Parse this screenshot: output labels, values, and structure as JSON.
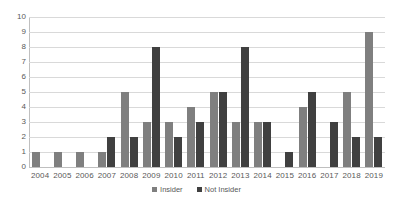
{
  "chart_data": {
    "type": "bar",
    "title": "",
    "subtitle": "",
    "xlabel": "",
    "ylabel": "",
    "ylim": [
      0,
      10
    ],
    "ytick_labels": [
      "10",
      "9",
      "8",
      "7",
      "6",
      "5",
      "4",
      "3",
      "2",
      "1",
      "0"
    ],
    "yticks": [
      10,
      9,
      8,
      7,
      6,
      5,
      4,
      3,
      2,
      1,
      0
    ],
    "grid": true,
    "grid_axis": "y",
    "legend_position": "bottom",
    "categories": [
      "2004",
      "2005",
      "2006",
      "2007",
      "2008",
      "2009",
      "2010",
      "2011",
      "2012",
      "2013",
      "2014",
      "2015",
      "2016",
      "2017",
      "2018",
      "2019"
    ],
    "series": [
      {
        "name": "Insider",
        "color": "#7f7f7f",
        "values": [
          1,
          1,
          1,
          1,
          5,
          3,
          3,
          4,
          5,
          3,
          3,
          0,
          4,
          0,
          5,
          9
        ]
      },
      {
        "name": "Not Insider",
        "color": "#404040",
        "values": [
          0,
          0,
          0,
          2,
          2,
          8,
          2,
          3,
          5,
          8,
          3,
          1,
          5,
          3,
          2,
          2
        ]
      }
    ]
  },
  "legend": {
    "items": [
      {
        "label": "Insider",
        "swatch": "legend-swatch-insider"
      },
      {
        "label": "Not Insider",
        "swatch": "legend-swatch-not-insider"
      }
    ]
  }
}
